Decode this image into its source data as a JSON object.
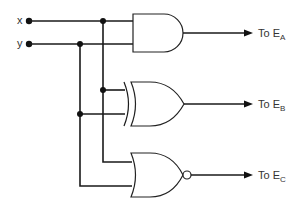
{
  "diagram": {
    "type": "logic-circuit",
    "inputs": [
      {
        "id": "x",
        "label": "x"
      },
      {
        "id": "y",
        "label": "y"
      }
    ],
    "gates": [
      {
        "id": "and",
        "type": "AND",
        "inputs": [
          "x",
          "y"
        ],
        "output": "E_A"
      },
      {
        "id": "xor",
        "type": "XOR",
        "inputs": [
          "x",
          "y"
        ],
        "output": "E_B"
      },
      {
        "id": "nor",
        "type": "NOR",
        "inputs": [
          "x",
          "y"
        ],
        "output": "E_C"
      }
    ],
    "outputs": [
      {
        "id": "ea",
        "prefix": "To E",
        "subscript": "A"
      },
      {
        "id": "eb",
        "prefix": "To E",
        "subscript": "B"
      },
      {
        "id": "ec",
        "prefix": "To E",
        "subscript": "C"
      }
    ]
  }
}
